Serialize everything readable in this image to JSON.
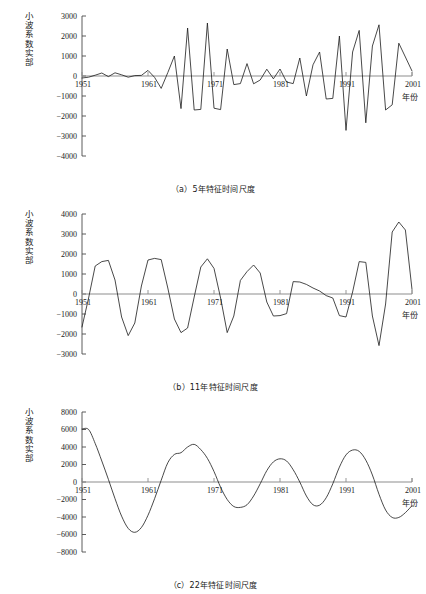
{
  "figure": {
    "ylabel_text": "小波系数实部",
    "xlabel_text": "年份"
  },
  "panels": [
    {
      "id": "panel-a",
      "caption": "（a）5年特征时间尺度",
      "ylabel": "小波系数实部",
      "xlabel": "年份"
    },
    {
      "id": "panel-b",
      "caption": "（b）11年特征时间尺度",
      "ylabel": "小波系数实部",
      "xlabel": "年份"
    },
    {
      "id": "panel-c",
      "caption": "（c）22年特征时间尺度",
      "ylabel": "小波系数实部",
      "xlabel": "年份"
    }
  ],
  "chart_data": [
    {
      "type": "line",
      "title": "（a）5年特征时间尺度",
      "xlabel": "年份",
      "ylabel": "小波系数实部",
      "xlim": [
        1951,
        2001
      ],
      "ylim": [
        -4000,
        3000
      ],
      "xticks": [
        1951,
        1961,
        1971,
        1981,
        1991,
        2001
      ],
      "yticks": [
        3000,
        2000,
        1000,
        0,
        -1000,
        -2000,
        -3000,
        -4000
      ],
      "xticklabels": [
        "1951",
        "1961",
        "1971",
        "1981",
        "1991",
        "2001"
      ],
      "yticklabels": [
        "3000",
        "2000",
        "1000",
        "0",
        "−1000",
        "−2000",
        "−3000",
        "−4000"
      ],
      "grid": false,
      "legend": null,
      "x": [
        1951,
        1952,
        1953,
        1954,
        1955,
        1956,
        1957,
        1958,
        1959,
        1960,
        1961,
        1962,
        1963,
        1964,
        1965,
        1966,
        1967,
        1968,
        1969,
        1970,
        1971,
        1972,
        1973,
        1974,
        1975,
        1976,
        1977,
        1978,
        1979,
        1980,
        1981,
        1982,
        1983,
        1984,
        1985,
        1986,
        1987,
        1988,
        1989,
        1990,
        1991,
        1992,
        1993,
        1994,
        1995,
        1996,
        1997,
        1998,
        1999,
        2000,
        2001
      ],
      "values": [
        -100,
        -60,
        40,
        150,
        -30,
        160,
        60,
        -60,
        20,
        30,
        280,
        -70,
        -620,
        170,
        1000,
        -1630,
        2400,
        -1700,
        -1670,
        2650,
        -1610,
        -1680,
        1350,
        -430,
        -380,
        620,
        -390,
        -200,
        340,
        -140,
        350,
        -300,
        -380,
        900,
        -1000,
        560,
        1200,
        -1150,
        -1120,
        2000,
        -2720,
        1200,
        2280,
        -2340,
        1500,
        2560,
        -1700,
        -1440,
        1640,
        950,
        250
      ]
    },
    {
      "type": "line",
      "title": "（b）11年特征时间尺度",
      "xlabel": "年份",
      "ylabel": "小波系数实部",
      "xlim": [
        1951,
        2001
      ],
      "ylim": [
        -3000,
        4000
      ],
      "xticks": [
        1951,
        1961,
        1971,
        1981,
        1991,
        2001
      ],
      "yticks": [
        4000,
        3000,
        2000,
        1000,
        0,
        -1000,
        -2000,
        -3000
      ],
      "xticklabels": [
        "1951",
        "1961",
        "1971",
        "1981",
        "1991",
        "2001"
      ],
      "yticklabels": [
        "4000",
        "3000",
        "2000",
        "1000",
        "0",
        "−1000",
        "−2000",
        "−3000"
      ],
      "grid": false,
      "legend": null,
      "x": [
        1951,
        1952,
        1953,
        1954,
        1955,
        1956,
        1957,
        1958,
        1959,
        1960,
        1961,
        1962,
        1963,
        1964,
        1965,
        1966,
        1967,
        1968,
        1969,
        1970,
        1971,
        1972,
        1973,
        1974,
        1975,
        1976,
        1977,
        1978,
        1979,
        1980,
        1981,
        1982,
        1983,
        1984,
        1985,
        1986,
        1987,
        1988,
        1989,
        1990,
        1991,
        1992,
        1993,
        1994,
        1995,
        1996,
        1997,
        1998,
        1999,
        2000,
        2001
      ],
      "values": [
        -1650,
        -200,
        1400,
        1620,
        1680,
        700,
        -1150,
        -2080,
        -1450,
        400,
        1700,
        1780,
        1720,
        300,
        -1250,
        -1930,
        -1700,
        -150,
        1350,
        1760,
        1280,
        -200,
        -1930,
        -1100,
        680,
        1120,
        1450,
        1050,
        -400,
        -1100,
        -1080,
        -980,
        620,
        600,
        480,
        300,
        150,
        -80,
        -200,
        -1080,
        -1150,
        100,
        1620,
        1580,
        -1100,
        -2580,
        -500,
        3100,
        3600,
        3200,
        230
      ]
    },
    {
      "type": "line",
      "title": "（c）22年特征时间尺度",
      "xlabel": "年份",
      "ylabel": "小波系数实部",
      "xlim": [
        1951,
        2001
      ],
      "ylim": [
        -8000,
        8000
      ],
      "xticks": [
        1951,
        1961,
        1971,
        1981,
        1991,
        2001
      ],
      "yticks": [
        8000,
        6000,
        4000,
        2000,
        0,
        -2000,
        -4000,
        -6000,
        -8000
      ],
      "xticklabels": [
        "1951",
        "1961",
        "1971",
        "1981",
        "1991",
        "2001"
      ],
      "yticklabels": [
        "8000",
        "6000",
        "4000",
        "2000",
        "0",
        "−2000",
        "−4000",
        "−6000",
        "−8000"
      ],
      "grid": false,
      "legend": null,
      "x": [
        1951,
        1952,
        1953,
        1954,
        1955,
        1956,
        1957,
        1958,
        1959,
        1960,
        1961,
        1962,
        1963,
        1964,
        1965,
        1966,
        1967,
        1968,
        1969,
        1970,
        1971,
        1972,
        1973,
        1974,
        1975,
        1976,
        1977,
        1978,
        1979,
        1980,
        1981,
        1982,
        1983,
        1984,
        1985,
        1986,
        1987,
        1988,
        1989,
        1990,
        1991,
        1992,
        1993,
        1994,
        1995,
        1996,
        1997,
        1998,
        1999,
        2000,
        2001
      ],
      "values": [
        6050,
        6000,
        4400,
        2400,
        300,
        -1900,
        -3900,
        -5300,
        -5750,
        -5200,
        -3800,
        -1900,
        200,
        2200,
        3150,
        3350,
        4000,
        4300,
        3700,
        2700,
        1200,
        -600,
        -2000,
        -2800,
        -2900,
        -2600,
        -1600,
        -200,
        1300,
        2300,
        2650,
        2400,
        1400,
        0,
        -1600,
        -2600,
        -2650,
        -1800,
        -200,
        1700,
        3100,
        3650,
        3500,
        2500,
        800,
        -1400,
        -3200,
        -4050,
        -4050,
        -3500,
        -2700
      ]
    }
  ]
}
